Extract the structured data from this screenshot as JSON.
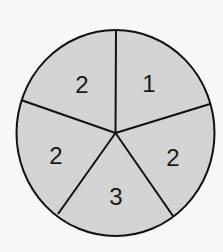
{
  "spinner": {
    "sections": [
      {
        "label": "1"
      },
      {
        "label": "2"
      },
      {
        "label": "3"
      },
      {
        "label": "2"
      },
      {
        "label": "2"
      }
    ],
    "fill_color": "#d4d4d4",
    "line_color": "#111111"
  }
}
